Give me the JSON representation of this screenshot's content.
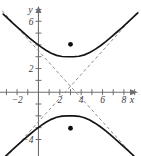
{
  "chart_data": {
    "type": "line",
    "title": "",
    "subtitle": "",
    "xlabel": "x",
    "ylabel": "y",
    "xlim": [
      -3.6,
      9.6
    ],
    "ylim": [
      -5.4,
      7.8
    ],
    "grid": false,
    "legend": null,
    "x_ticks": [
      -3,
      -2,
      -1,
      0,
      1,
      2,
      3,
      4,
      5,
      6,
      7,
      8,
      9
    ],
    "x_tick_labels": [
      {
        "value": -2,
        "label": "−2"
      },
      {
        "value": 2,
        "label": "2"
      },
      {
        "value": 4,
        "label": "4"
      },
      {
        "value": 6,
        "label": "6"
      },
      {
        "value": 8,
        "label": "8"
      }
    ],
    "y_ticks": [
      -4,
      -3,
      -2,
      -1,
      0,
      1,
      2,
      3,
      4,
      5,
      6,
      7
    ],
    "y_tick_labels": [
      {
        "value": 6,
        "label": "6"
      },
      {
        "value": 2,
        "label": "2"
      },
      {
        "value": -4,
        "label": "−4"
      }
    ],
    "conic": {
      "kind": "hyperbola",
      "orientation": "vertical-transverse-axis",
      "center": [
        3,
        0.5
      ],
      "a": 2.5,
      "b": 2.5,
      "vertices": [
        [
          3,
          3
        ],
        [
          3,
          -2
        ]
      ],
      "foci": [
        [
          3,
          4.05
        ],
        [
          3,
          -3.05
        ]
      ],
      "asymptote_slopes": [
        1,
        -1
      ],
      "asymptote_equations": [
        "y = x - 2.5",
        "y = -x + 3.5"
      ]
    },
    "series": [
      {
        "name": "upper-branch",
        "style": "solid",
        "color": "#141414",
        "points": [
          [
            -3.3,
            6.6
          ],
          [
            -2.8,
            6.18
          ],
          [
            -2.3,
            5.76
          ],
          [
            -1.8,
            5.35
          ],
          [
            -1.3,
            4.95
          ],
          [
            -0.8,
            4.56
          ],
          [
            -0.3,
            4.19
          ],
          [
            0.2,
            3.85
          ],
          [
            0.7,
            3.55
          ],
          [
            1.2,
            3.3
          ],
          [
            1.7,
            3.12
          ],
          [
            2.2,
            3.02
          ],
          [
            2.7,
            3.0
          ],
          [
            3.0,
            3.0
          ],
          [
            3.3,
            3.0
          ],
          [
            3.8,
            3.04
          ],
          [
            4.3,
            3.16
          ],
          [
            4.8,
            3.36
          ],
          [
            5.3,
            3.62
          ],
          [
            5.8,
            3.93
          ],
          [
            6.3,
            4.28
          ],
          [
            6.8,
            4.66
          ],
          [
            7.3,
            5.05
          ],
          [
            7.8,
            5.45
          ],
          [
            8.3,
            5.87
          ],
          [
            8.8,
            6.29
          ],
          [
            9.3,
            6.71
          ]
        ]
      },
      {
        "name": "lower-branch",
        "style": "solid",
        "color": "#141414",
        "points": [
          [
            -3.3,
            -5.6
          ],
          [
            -2.8,
            -5.18
          ],
          [
            -2.3,
            -4.76
          ],
          [
            -1.8,
            -4.35
          ],
          [
            -1.3,
            -3.95
          ],
          [
            -0.8,
            -3.56
          ],
          [
            -0.3,
            -3.19
          ],
          [
            0.2,
            -2.85
          ],
          [
            0.7,
            -2.55
          ],
          [
            1.2,
            -2.3
          ],
          [
            1.7,
            -2.12
          ],
          [
            2.2,
            -2.02
          ],
          [
            2.7,
            -2.0
          ],
          [
            3.0,
            -2.0
          ],
          [
            3.3,
            -2.0
          ],
          [
            3.8,
            -2.04
          ],
          [
            4.3,
            -2.16
          ],
          [
            4.8,
            -2.36
          ],
          [
            5.3,
            -2.62
          ],
          [
            5.8,
            -2.93
          ],
          [
            6.3,
            -3.28
          ],
          [
            6.8,
            -3.66
          ],
          [
            7.3,
            -4.05
          ],
          [
            7.8,
            -4.45
          ],
          [
            8.3,
            -4.87
          ],
          [
            8.8,
            -5.29
          ],
          [
            9.3,
            -5.71
          ]
        ]
      },
      {
        "name": "asymptote-positive-slope",
        "style": "dashed",
        "color": "#8c8c92",
        "points": [
          [
            -3.4,
            -5.9
          ],
          [
            9.4,
            6.9
          ]
        ]
      },
      {
        "name": "asymptote-negative-slope",
        "style": "dashed",
        "color": "#8c8c92",
        "points": [
          [
            -3.4,
            6.9
          ],
          [
            9.4,
            -5.9
          ]
        ]
      }
    ],
    "point_markers": [
      {
        "name": "focus-upper",
        "x": 3,
        "y": 4.05
      },
      {
        "name": "focus-lower",
        "x": 3,
        "y": -3.05
      }
    ]
  },
  "colors": {
    "background": "#ffffff",
    "axis": "#6e6e72",
    "curve": "#141414",
    "asymptote": "#8c8c92",
    "marker": "#0d0d0d",
    "label": "#3c3c40"
  }
}
